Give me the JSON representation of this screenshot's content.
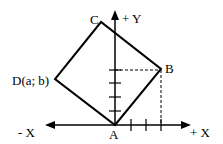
{
  "diagram": {
    "type": "coordinate-square",
    "points": {
      "A": {
        "label": "A",
        "x": 115,
        "y": 125
      },
      "B": {
        "label": "B",
        "x": 161,
        "y": 69
      },
      "C": {
        "label": "C",
        "x": 101,
        "y": 22
      },
      "D": {
        "label": "D(a; b)",
        "x": 55,
        "y": 79
      }
    },
    "axes": {
      "x_pos_label": "+ X",
      "x_neg_label": "- X",
      "y_pos_label": "+ Y"
    },
    "ticks": {
      "y": [
        70,
        83,
        97,
        111
      ],
      "x": [
        131,
        146,
        161
      ]
    },
    "colors": {
      "stroke": "#000000",
      "background": "#ffffff"
    }
  }
}
